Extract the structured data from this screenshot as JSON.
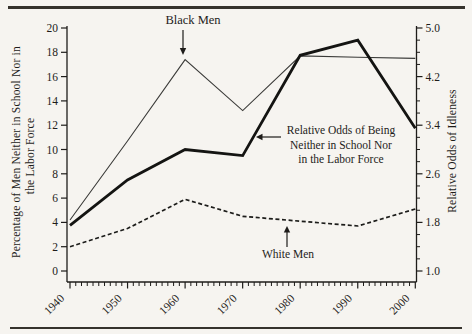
{
  "page": {
    "background": "#f6f4f0",
    "ink": "#1e1c1a",
    "rule_color": "#35322c",
    "thin_line_color": "#3a3a38",
    "thick_line_color": "#141412",
    "dashed_line_color": "#1c1c1a"
  },
  "chart_data": {
    "type": "line",
    "x": [
      1940,
      1950,
      1960,
      1970,
      1980,
      1990,
      2000
    ],
    "x_axis": {
      "ticks": [
        1940,
        1950,
        1960,
        1970,
        1980,
        1990,
        2000
      ],
      "minor_step_years": 1,
      "range": [
        1940,
        2000
      ]
    },
    "left_axis": {
      "title": "Percentage of Men Neither in School Nor in the Labor Force",
      "title_lines": [
        "Percentage of Men Neither in School Nor in",
        "the Labor Force"
      ],
      "range": [
        0,
        20
      ],
      "ticks": [
        0,
        2,
        4,
        6,
        8,
        10,
        12,
        14,
        16,
        18,
        20
      ]
    },
    "right_axis": {
      "title": "Relative Odds of Idleness",
      "range": [
        1.0,
        5.0
      ],
      "ticks": [
        "1.0",
        "1.8",
        "2.6",
        "3.4",
        "4.2",
        "5.0"
      ],
      "minor_step": 0.2
    },
    "grid": false,
    "legend": "in-plot arrow annotations",
    "series": [
      {
        "id": "black_men",
        "name": "Black Men",
        "axis": "left",
        "line": "thin-solid",
        "values": [
          4.2,
          10.7,
          17.4,
          13.2,
          17.7,
          17.6,
          17.5
        ]
      },
      {
        "id": "relative_odds",
        "name": "Relative Odds of Being Neither in School Nor in the Labor Force",
        "axis": "right",
        "line": "thick-solid",
        "values": [
          1.75,
          2.5,
          3.0,
          2.9,
          4.55,
          4.8,
          3.35
        ]
      },
      {
        "id": "white_men",
        "name": "White Men",
        "axis": "left",
        "line": "dashed",
        "values": [
          2.0,
          3.5,
          5.9,
          4.5,
          4.1,
          3.7,
          5.1
        ]
      }
    ],
    "annotations": [
      {
        "id": "black_men_label",
        "text": "Black Men",
        "arrow": "down"
      },
      {
        "id": "white_men_label",
        "text": "White Men",
        "arrow": "up"
      },
      {
        "id": "odds_label",
        "lines": [
          "Relative Odds of Being",
          "Neither in School Nor",
          "in the Labor Force"
        ],
        "arrow": "left"
      }
    ]
  }
}
